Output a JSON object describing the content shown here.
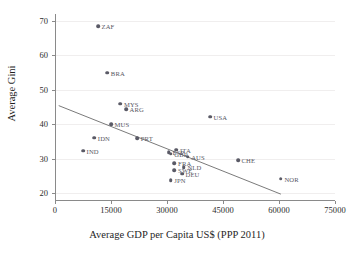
{
  "chart_data": {
    "type": "scatter",
    "title": "",
    "xlabel": "Average GDP per Capita US$ (PPP 2011)",
    "ylabel": "Average Gini",
    "xlim": [
      0,
      75000
    ],
    "ylim": [
      18,
      72
    ],
    "xticks": [
      0,
      15000,
      30000,
      45000,
      60000,
      75000
    ],
    "yticks": [
      20,
      30,
      40,
      50,
      60,
      70
    ],
    "xtick_labels": [
      "0",
      "15000",
      "30000",
      "45000",
      "60000",
      "75000"
    ],
    "ytick_labels": [
      "20",
      "30",
      "40",
      "50",
      "60",
      "70"
    ],
    "grid": "horizontal",
    "legend": "none",
    "point_color": "#5a5a66",
    "trend_color": "#6b6b6b",
    "trendline": {
      "label": "linear fit",
      "x_start": 1000,
      "y_start": 45.4,
      "x_end": 60500,
      "y_end": 19.7
    },
    "points": [
      {
        "label": "ZAF",
        "x": 11500,
        "y": 68.5
      },
      {
        "label": "BRA",
        "x": 14000,
        "y": 55.0
      },
      {
        "label": "MYS",
        "x": 17500,
        "y": 45.9
      },
      {
        "label": "ARG",
        "x": 19000,
        "y": 44.4
      },
      {
        "label": "USA",
        "x": 41500,
        "y": 42.2
      },
      {
        "label": "MUS",
        "x": 15000,
        "y": 40.0
      },
      {
        "label": "IDN",
        "x": 10500,
        "y": 36.1
      },
      {
        "label": "PRT",
        "x": 22000,
        "y": 35.9
      },
      {
        "label": "IND",
        "x": 7500,
        "y": 32.3
      },
      {
        "label": "ITA",
        "x": 32500,
        "y": 32.6
      },
      {
        "label": "ESP",
        "x": 30500,
        "y": 31.8
      },
      {
        "label": "GBR",
        "x": 31000,
        "y": 31.5
      },
      {
        "label": "AUS",
        "x": 35500,
        "y": 30.6
      },
      {
        "label": "CHE",
        "x": 49000,
        "y": 29.5
      },
      {
        "label": "FRA",
        "x": 32000,
        "y": 28.7
      },
      {
        "label": "NLD",
        "x": 34500,
        "y": 27.5
      },
      {
        "label": "SWE",
        "x": 32000,
        "y": 26.6
      },
      {
        "label": "DEU",
        "x": 34000,
        "y": 25.6
      },
      {
        "label": "NOR",
        "x": 60500,
        "y": 24.2
      },
      {
        "label": "JPN",
        "x": 31000,
        "y": 23.8
      }
    ]
  }
}
